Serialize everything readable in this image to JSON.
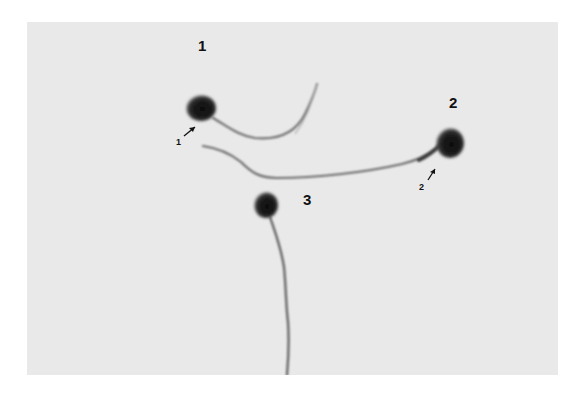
{
  "figure": {
    "background_color": "#e9e9e9",
    "cell_color": "#1a1a1a",
    "tail_color": "#6a6a6a",
    "cells": [
      {
        "id": "1",
        "label": "1",
        "arrow_label": "1",
        "head": {
          "cx": 174,
          "cy": 86
        },
        "has_arrow": true
      },
      {
        "id": "2",
        "label": "2",
        "arrow_label": "2",
        "head": {
          "cx": 421,
          "cy": 122
        },
        "has_arrow": true
      },
      {
        "id": "3",
        "label": "3",
        "head": {
          "cx": 239,
          "cy": 183
        },
        "has_arrow": false
      }
    ]
  }
}
